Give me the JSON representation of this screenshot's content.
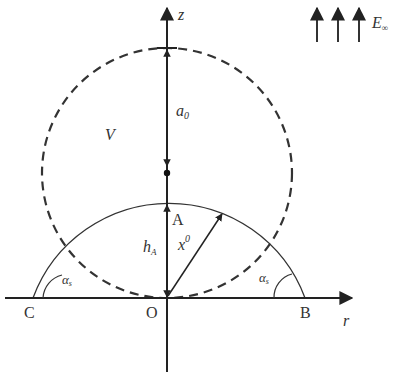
{
  "diagram": {
    "axes": {
      "vertical_label": "z",
      "horizontal_label": "r"
    },
    "field": {
      "label_main": "E",
      "label_sub": "∞",
      "arrow_count": 3
    },
    "volume_label": "V",
    "radius_label_main": "a",
    "radius_label_sub": "0",
    "points": {
      "A": "A",
      "B": "B",
      "C": "C",
      "O": "O"
    },
    "height_label_main": "h",
    "height_label_sub": "A",
    "position_vector_main": "x",
    "position_vector_sup": "0",
    "contact_angle_main": "α",
    "contact_angle_sub": "s",
    "colors": {
      "stroke": "#222222",
      "text": "#333333",
      "background": "#ffffff"
    }
  }
}
